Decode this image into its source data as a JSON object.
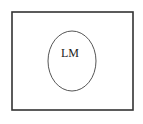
{
  "diagram": {
    "type": "venn",
    "universe": {
      "label": "",
      "x": 12,
      "y": 12,
      "width": 121,
      "height": 98,
      "stroke": "#333333"
    },
    "sets": [
      {
        "label": "LM",
        "cx": 72,
        "cy": 61,
        "rx": 24,
        "ry": 30,
        "stroke": "#555555"
      }
    ]
  }
}
